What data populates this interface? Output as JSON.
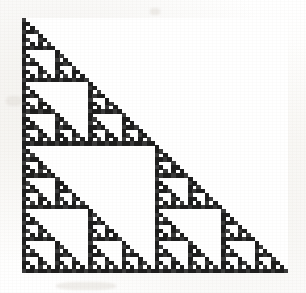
{
  "figure": {
    "kind": "binary-matrix-spy-plot",
    "background_color": "#ffffff",
    "paper_tint_color": "#fcfbf9",
    "ink_color": "#1d1d1d",
    "ink_color_secondary": "#3a3a3a",
    "plot_left_px": 22,
    "plot_top_px": 18,
    "plot_width_px": 266,
    "plot_height_px": 255
  },
  "chart_data": {
    "type": "heatmap",
    "title": "",
    "subtitle": "",
    "xlabel": "",
    "ylabel": "",
    "legend": [],
    "annotations": [],
    "grid": false,
    "legend_position": "none",
    "colormap": [
      "#ffffff",
      "#1d1d1d"
    ],
    "value_labels": {
      "0": "zero / empty",
      "1": "nonzero / filled"
    },
    "matrix_order": 64,
    "rows": 64,
    "cols": 64,
    "xlim": [
      0,
      64
    ],
    "ylim": [
      64,
      0
    ],
    "x_tick_labels": [],
    "y_tick_labels": [],
    "cell_width_px": 4.156,
    "cell_height_px": 3.984,
    "structure": "lower-triangular",
    "generator": "pascal-mod-2",
    "generator_rule": "M[i][j] = 1 if j<=i and (i-j) AND j == 0, i.e. binomial(i,j) is odd (Sierpinski / Pascal mod 2)",
    "self_similar_scale_factor": 2,
    "recursion_depth": 6,
    "density_estimate_percent": 41,
    "nonzero_count": 729,
    "total_cells": 4096,
    "suppressed_blocks": [
      {
        "row": 0,
        "col": 32,
        "size": 32,
        "note": "upper-right zero block"
      },
      {
        "row": 8,
        "col": 16,
        "size": 8,
        "note": "interior zero block"
      },
      {
        "row": 16,
        "col": 32,
        "size": 16,
        "note": "interior zero block"
      },
      {
        "row": 32,
        "col": 48,
        "size": 16,
        "note": "interior zero block"
      }
    ]
  }
}
